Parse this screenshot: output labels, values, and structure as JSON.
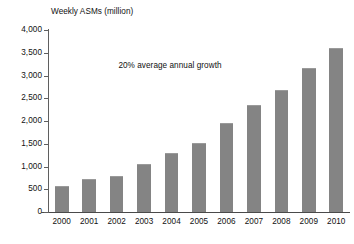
{
  "chart_data": {
    "type": "bar",
    "title": "Weekly ASMs (million)",
    "xlabel": "",
    "ylabel": "",
    "categories": [
      "2000",
      "2001",
      "2002",
      "2003",
      "2004",
      "2005",
      "2006",
      "2007",
      "2008",
      "2009",
      "2010"
    ],
    "values": [
      550,
      700,
      770,
      1030,
      1270,
      1490,
      1940,
      2340,
      2670,
      3150,
      3580
    ],
    "ylim": [
      0,
      4000
    ],
    "y_ticks": [
      0,
      500,
      1000,
      1500,
      2000,
      2500,
      3000,
      3500,
      4000
    ],
    "y_tick_labels": [
      "0",
      "500",
      "1,000",
      "1,500",
      "2,000",
      "2,500",
      "3,000",
      "3,500",
      "4,000"
    ],
    "annotations": [
      "20% average annual growth"
    ],
    "grid": false,
    "legend": false,
    "bar_color": "#848484",
    "axis_color": "#5f5f5f"
  },
  "chart": {
    "title": "Weekly ASMs (million)",
    "annotation": "20% average annual growth"
  }
}
